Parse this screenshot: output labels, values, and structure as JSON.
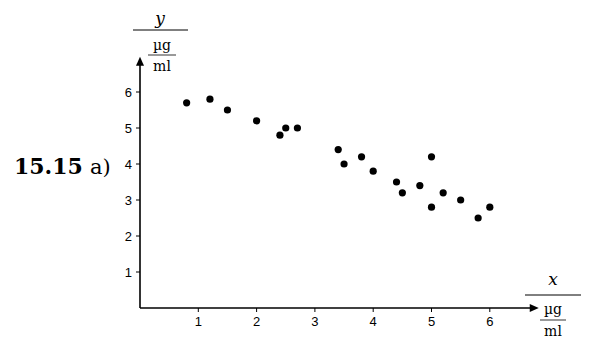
{
  "figure_label": {
    "number": "15.15",
    "part": "a)"
  },
  "chart_data": {
    "type": "scatter",
    "title": "",
    "xlabel": "x",
    "xunit_num": "µg",
    "xunit_den": "ml",
    "ylabel": "y",
    "yunit_num": "µg",
    "yunit_den": "ml",
    "xlim": [
      0,
      6.6
    ],
    "ylim": [
      0,
      6.7
    ],
    "xticks": [
      1,
      2,
      3,
      4,
      5,
      6
    ],
    "yticks": [
      1,
      2,
      3,
      4,
      5,
      6
    ],
    "grid": false,
    "legend": "none",
    "points": [
      {
        "x": 0.8,
        "y": 5.7
      },
      {
        "x": 1.2,
        "y": 5.8
      },
      {
        "x": 1.5,
        "y": 5.5
      },
      {
        "x": 2.0,
        "y": 5.2
      },
      {
        "x": 2.4,
        "y": 4.8
      },
      {
        "x": 2.5,
        "y": 5.0
      },
      {
        "x": 2.7,
        "y": 5.0
      },
      {
        "x": 3.4,
        "y": 4.4
      },
      {
        "x": 3.5,
        "y": 4.0
      },
      {
        "x": 3.8,
        "y": 4.2
      },
      {
        "x": 4.0,
        "y": 3.8
      },
      {
        "x": 4.4,
        "y": 3.5
      },
      {
        "x": 4.5,
        "y": 3.2
      },
      {
        "x": 4.8,
        "y": 3.4
      },
      {
        "x": 5.0,
        "y": 4.2
      },
      {
        "x": 5.0,
        "y": 2.8
      },
      {
        "x": 5.2,
        "y": 3.2
      },
      {
        "x": 5.5,
        "y": 3.0
      },
      {
        "x": 5.8,
        "y": 2.5
      },
      {
        "x": 6.0,
        "y": 2.8
      }
    ],
    "marker_color": "#000000",
    "axis_color": "#000000"
  }
}
